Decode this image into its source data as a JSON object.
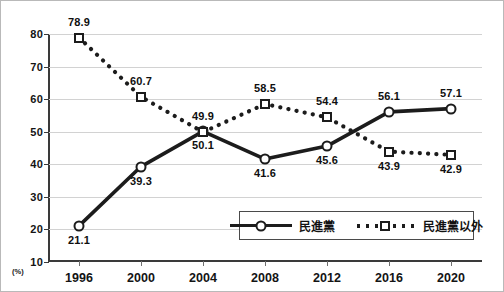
{
  "chart_data": {
    "type": "line",
    "title": "",
    "subtitle": "",
    "xlabel": "",
    "ylabel": "",
    "unit_label": "(%)",
    "categories": [
      "1996",
      "2000",
      "2004",
      "2008",
      "2012",
      "2016",
      "2020"
    ],
    "ylim": [
      10,
      80
    ],
    "yticks": [
      10,
      20,
      30,
      40,
      50,
      60,
      70,
      80
    ],
    "grid": true,
    "legend_position": "inside-bottom-right",
    "series": [
      {
        "name": "民進黨",
        "marker": "open-circle",
        "linestyle": "solid",
        "color": "#1c1c1c",
        "values": [
          21.1,
          39.3,
          50.1,
          41.6,
          45.6,
          56.1,
          57.1
        ],
        "labels": [
          "21.1",
          "39.3",
          "50.1",
          "41.6",
          "45.6",
          "56.1",
          "57.1"
        ],
        "label_positions": [
          "below",
          "below",
          "below",
          "below",
          "below",
          "above",
          "above"
        ]
      },
      {
        "name": "民進黨以外",
        "marker": "open-square",
        "linestyle": "dotted",
        "color": "#1c1c1c",
        "values": [
          78.9,
          60.7,
          49.9,
          58.5,
          54.4,
          43.9,
          42.9
        ],
        "labels": [
          "78.9",
          "60.7",
          "49.9",
          "58.5",
          "54.4",
          "43.9",
          "42.9"
        ],
        "label_positions": [
          "above",
          "above",
          "above",
          "above",
          "above",
          "below",
          "below"
        ]
      }
    ]
  },
  "legend": {
    "items": [
      {
        "label": "民進黨",
        "style": "solid-circle"
      },
      {
        "label": "民進黨以外",
        "style": "dotted-square"
      }
    ]
  },
  "axes": {
    "y_tick_labels": [
      "80",
      "70",
      "60",
      "50",
      "40",
      "30",
      "20",
      "10"
    ],
    "x_tick_labels": [
      "1996",
      "2000",
      "2004",
      "2008",
      "2012",
      "2016",
      "2020"
    ],
    "unit": "(%)"
  }
}
